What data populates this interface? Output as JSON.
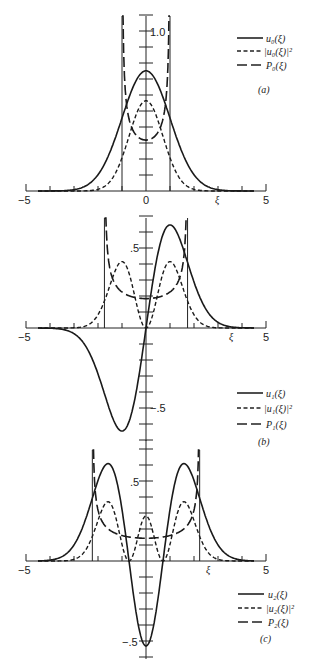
{
  "chart_data": [
    {
      "type": "line",
      "panel_label": "(a)",
      "xlabel": "ξ",
      "x_ticks": [
        "-5",
        "0",
        "5"
      ],
      "xlim": [
        -5,
        5
      ],
      "y_ticks_labeled": [
        "1.0"
      ],
      "ylim": [
        0,
        1.1
      ],
      "grid": false,
      "legend_position": "upper right",
      "series": [
        {
          "name": "u0(ξ)",
          "style": "solid",
          "formula": "pi^-0.25 * exp(-ξ^2/2)",
          "peak": 0.751
        },
        {
          "name": "|u0(ξ)|^2",
          "style": "short-dash",
          "peak": 0.564
        },
        {
          "name": "P0(ξ)",
          "style": "long-dash",
          "formula": "1/(pi*sqrt(1-ξ^2))",
          "walls": [
            -1,
            1
          ],
          "min": 0.318
        }
      ]
    },
    {
      "type": "line",
      "panel_label": "(b)",
      "xlabel": "ξ",
      "x_ticks": [
        "-5",
        "5"
      ],
      "xlim": [
        -5,
        5
      ],
      "y_ticks_labeled": [
        ".5",
        "-.5"
      ],
      "ylim": [
        -0.7,
        0.8
      ],
      "grid": false,
      "legend_position": "lower right",
      "series": [
        {
          "name": "u1(ξ)",
          "style": "solid",
          "formula": "pi^-0.25*sqrt(2)*ξ*exp(-ξ^2/2)",
          "peak": 0.644,
          "trough": -0.644
        },
        {
          "name": "|u1(ξ)|^2",
          "style": "short-dash",
          "peak": 0.415
        },
        {
          "name": "P1(ξ)",
          "style": "long-dash",
          "formula": "1/(pi*sqrt(3-ξ^2))",
          "walls": [
            -1.732,
            1.732
          ],
          "min": 0.184
        }
      ]
    },
    {
      "type": "line",
      "panel_label": "(c)",
      "xlabel": "ξ",
      "x_ticks": [
        "-5",
        "5"
      ],
      "xlim": [
        -5,
        5
      ],
      "y_ticks_labeled": [
        ".5",
        "-.5"
      ],
      "ylim": [
        -0.6,
        0.8
      ],
      "grid": false,
      "legend_position": "lower right",
      "series": [
        {
          "name": "u2(ξ)",
          "style": "solid",
          "formula": "pi^-0.25*(2ξ^2-1)/sqrt(2)*exp(-ξ^2/2)",
          "peak": 0.614,
          "trough": -0.531
        },
        {
          "name": "|u2(ξ)|^2",
          "style": "short-dash",
          "peak": 0.377,
          "center": 0.282
        },
        {
          "name": "P2(ξ)",
          "style": "long-dash",
          "formula": "1/(pi*sqrt(5-ξ^2))",
          "walls": [
            -2.236,
            2.236
          ],
          "min": 0.142
        }
      ]
    }
  ],
  "panels": [
    {
      "label": "(a)",
      "xi_label": "ξ",
      "x_tick_labels": {
        "min": "−5",
        "zero": "0",
        "max": "5"
      },
      "y_tick_labels": {
        "top": "1.0"
      },
      "legend": [
        {
          "label": "u₀(ξ)"
        },
        {
          "label": "|u₀(ξ)|²"
        },
        {
          "label": "P₀(ξ)"
        }
      ]
    },
    {
      "label": "(b)",
      "xi_label": "ξ",
      "x_tick_labels": {
        "min": "−5",
        "max": "5"
      },
      "y_tick_labels": {
        "pos": ".5",
        "neg": "−.5"
      },
      "legend": [
        {
          "label": "u₁(ξ)"
        },
        {
          "label": "|u₁(ξ)|²"
        },
        {
          "label": "P₁(ξ)"
        }
      ]
    },
    {
      "label": "(c)",
      "xi_label": "ξ",
      "x_tick_labels": {
        "min": "−5",
        "max": "5"
      },
      "y_tick_labels": {
        "pos": ".5",
        "neg": "−.5"
      },
      "legend": [
        {
          "label": "u₂(ξ)"
        },
        {
          "label": "|u₂(ξ)|²"
        },
        {
          "label": "P₂(ξ)"
        }
      ]
    }
  ]
}
